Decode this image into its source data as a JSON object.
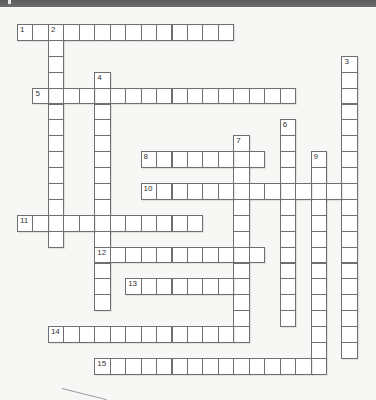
{
  "puzzle": {
    "type": "crossword",
    "grid_origin": {
      "x": 17,
      "y": 24
    },
    "cell_pitch": {
      "x": 15.45,
      "y": 15.9
    },
    "colors": {
      "cell_fill": "#ffffff",
      "cell_border": "#6f6f6f",
      "background": "#f7f7f5",
      "top_bar": "#626262"
    },
    "entries": [
      {
        "number": "1",
        "direction": "across",
        "row": 0,
        "col": 0,
        "length": 14
      },
      {
        "number": "2",
        "direction": "down",
        "row": 0,
        "col": 2,
        "length": 14
      },
      {
        "number": "3",
        "direction": "down",
        "row": 2,
        "col": 21,
        "length": 19
      },
      {
        "number": "4",
        "direction": "down",
        "row": 3,
        "col": 5,
        "length": 15
      },
      {
        "number": "5",
        "direction": "across",
        "row": 4,
        "col": 1,
        "length": 17
      },
      {
        "number": "6",
        "direction": "down",
        "row": 6,
        "col": 17,
        "length": 13
      },
      {
        "number": "7",
        "direction": "down",
        "row": 7,
        "col": 14,
        "length": 13
      },
      {
        "number": "8",
        "direction": "across",
        "row": 8,
        "col": 8,
        "length": 8
      },
      {
        "number": "9",
        "direction": "down",
        "row": 8,
        "col": 19,
        "length": 14
      },
      {
        "number": "10",
        "direction": "across",
        "row": 10,
        "col": 8,
        "length": 14
      },
      {
        "number": "11",
        "direction": "across",
        "row": 12,
        "col": 0,
        "length": 12
      },
      {
        "number": "12",
        "direction": "across",
        "row": 14,
        "col": 5,
        "length": 11
      },
      {
        "number": "13",
        "direction": "across",
        "row": 16,
        "col": 7,
        "length": 8
      },
      {
        "number": "14",
        "direction": "across",
        "row": 19,
        "col": 2,
        "length": 13
      },
      {
        "number": "15",
        "direction": "across",
        "row": 21,
        "col": 5,
        "length": 15
      }
    ]
  }
}
